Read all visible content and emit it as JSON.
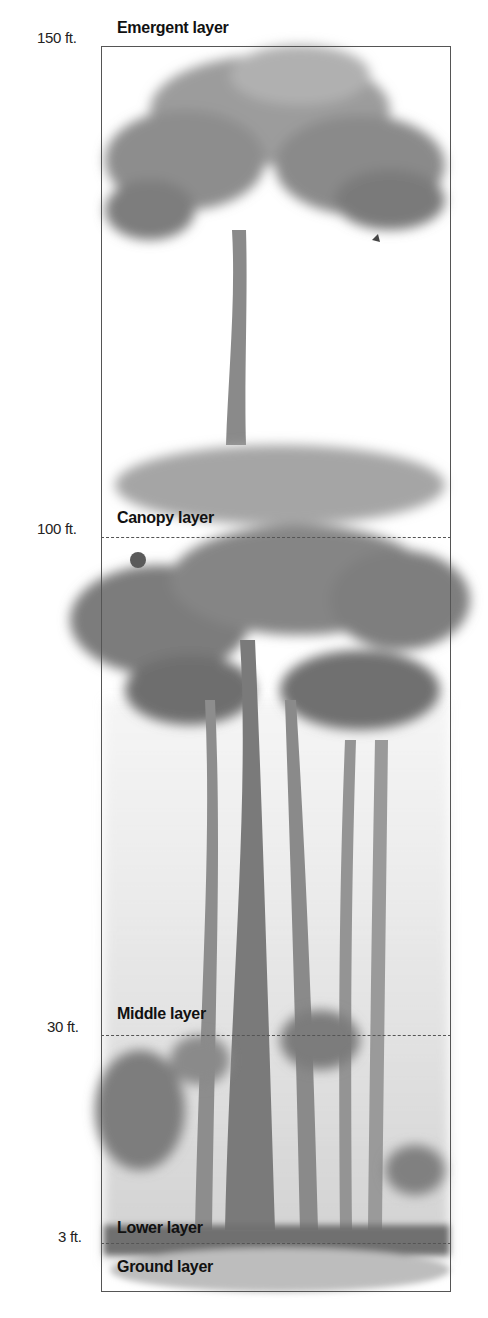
{
  "diagram": {
    "layers": [
      {
        "name": "Emergent layer",
        "height_label": "150 ft.",
        "line_y": 47
      },
      {
        "name": "Canopy layer",
        "height_label": "100 ft.",
        "line_y": 538
      },
      {
        "name": "Middle layer",
        "height_label": "30 ft.",
        "line_y": 1035
      },
      {
        "name": "Lower layer",
        "height_label": "3 ft.",
        "line_y": 1243
      },
      {
        "name": "Ground layer",
        "height_label": "",
        "line_y": null
      }
    ]
  },
  "colors": {
    "frame": "#555555",
    "foliage_dark": "#6e6e6e",
    "foliage_light": "#a8a8a8",
    "trunk": "#7a7a7a",
    "text": "#111111"
  }
}
